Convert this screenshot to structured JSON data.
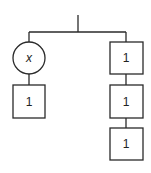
{
  "diagram": {
    "type": "tree",
    "root": {
      "label": ""
    },
    "left_branch": {
      "nodes": [
        {
          "shape": "circle",
          "label": "x"
        },
        {
          "shape": "square",
          "label": "1"
        }
      ]
    },
    "right_branch": {
      "nodes": [
        {
          "shape": "square",
          "label": "1"
        },
        {
          "shape": "square",
          "label": "1"
        },
        {
          "shape": "square",
          "label": "1"
        }
      ]
    },
    "colors": {
      "stroke": "#2a2a2a",
      "fill": "#ffffff",
      "background": "#ffffff"
    }
  }
}
